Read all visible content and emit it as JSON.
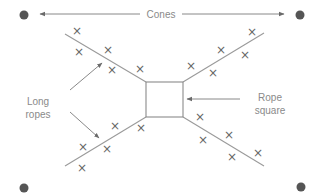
{
  "labels": {
    "cones": "Cones",
    "long_ropes_line1": "Long",
    "long_ropes_line2": "ropes",
    "rope_square_line1": "Rope",
    "rope_square_line2": "square"
  },
  "colors": {
    "cone": "#555555",
    "rope": "#9a9a9a",
    "text": "#8a8a8a",
    "mark": "#666666"
  },
  "marker_glyph": "×",
  "cones": [
    {
      "x": 24,
      "y": 15
    },
    {
      "x": 300,
      "y": 15
    },
    {
      "x": 24,
      "y": 188
    },
    {
      "x": 301,
      "y": 187
    }
  ],
  "rope_square": {
    "x": 146,
    "y": 82,
    "width": 37,
    "height": 35
  },
  "ropes": [
    {
      "x1": 65,
      "y1": 34,
      "x2": 146,
      "y2": 82
    },
    {
      "x1": 183,
      "y1": 82,
      "x2": 264,
      "y2": 33
    },
    {
      "x1": 146,
      "y1": 117,
      "x2": 65,
      "y2": 166
    },
    {
      "x1": 183,
      "y1": 117,
      "x2": 264,
      "y2": 166
    }
  ],
  "markers": [
    {
      "x": 77,
      "y": 31
    },
    {
      "x": 79,
      "y": 52
    },
    {
      "x": 108,
      "y": 50
    },
    {
      "x": 112,
      "y": 70
    },
    {
      "x": 140,
      "y": 69
    },
    {
      "x": 191,
      "y": 66
    },
    {
      "x": 213,
      "y": 73
    },
    {
      "x": 221,
      "y": 50
    },
    {
      "x": 245,
      "y": 55
    },
    {
      "x": 252,
      "y": 32
    },
    {
      "x": 82,
      "y": 168
    },
    {
      "x": 83,
      "y": 147
    },
    {
      "x": 107,
      "y": 149
    },
    {
      "x": 115,
      "y": 126
    },
    {
      "x": 141,
      "y": 128
    },
    {
      "x": 200,
      "y": 117
    },
    {
      "x": 203,
      "y": 140
    },
    {
      "x": 229,
      "y": 135
    },
    {
      "x": 232,
      "y": 157
    },
    {
      "x": 258,
      "y": 153
    }
  ]
}
